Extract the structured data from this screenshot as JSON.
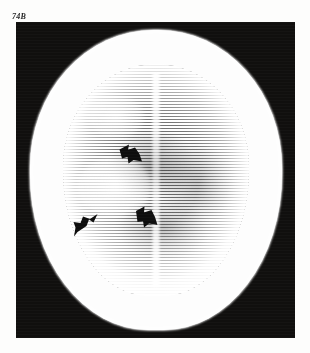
{
  "figure": {
    "label": "74B",
    "modality": "axial head CT",
    "frame": {
      "background_color": "#100f0e",
      "left": 16,
      "top": 22,
      "width": 279,
      "height": 316
    }
  },
  "page": {
    "background_color": "#fdfdfc",
    "width": 310,
    "height": 353
  },
  "scan": {
    "skull_color": "#fdfdfd",
    "parenchyma_color": "#ffffff",
    "texture": "horizontal halftone scan lines",
    "midline": "interhemispheric fissure"
  },
  "annotations": {
    "arrow_color": "#0d0d0d",
    "count": 3,
    "arrows": [
      {
        "name": "arrow-superior",
        "direction": "up-left",
        "x": 102,
        "y": 120
      },
      {
        "name": "arrow-lateral",
        "direction": "up-right",
        "x": 57,
        "y": 190
      },
      {
        "name": "arrow-medial",
        "direction": "up-left",
        "x": 118,
        "y": 183
      }
    ]
  }
}
